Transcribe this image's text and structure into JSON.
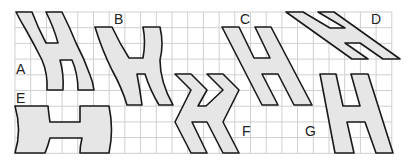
{
  "diagram": {
    "type": "grid-shapes",
    "grid": {
      "x0": 15,
      "y0": 12,
      "cell": 15.7,
      "cols": 24,
      "rows": 9,
      "line_color": "#cfcfcf"
    },
    "colors": {
      "fill": "#e6e6e6",
      "stroke": "#1a1a1a",
      "background": "#ffffff"
    },
    "shapes": [
      {
        "id": "A",
        "label": "A",
        "label_pos": [
          17,
          75
        ]
      },
      {
        "id": "B",
        "label": "B",
        "label_pos": [
          112,
          24
        ]
      },
      {
        "id": "C",
        "label": "C",
        "label_pos": [
          240,
          24
        ]
      },
      {
        "id": "D",
        "label": "D",
        "label_pos": [
          371,
          24
        ]
      },
      {
        "id": "E",
        "label": "E",
        "label_pos": [
          17,
          103
        ]
      },
      {
        "id": "F",
        "label": "F",
        "label_pos": [
          241,
          136
        ]
      },
      {
        "id": "G",
        "label": "G",
        "label_pos": [
          304,
          136
        ]
      }
    ]
  }
}
